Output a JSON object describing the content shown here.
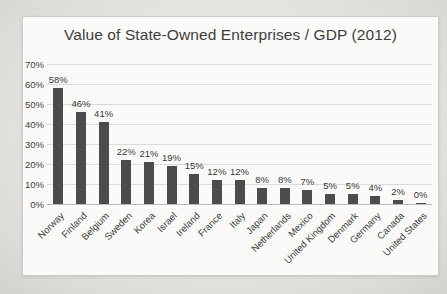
{
  "chart_data": {
    "type": "bar",
    "title": "Value of State-Owned Enterprises / GDP (2012)",
    "categories": [
      "Norway",
      "Finland",
      "Belgium",
      "Sweden",
      "Korea",
      "Israel",
      "Ireland",
      "France",
      "Italy",
      "Japan",
      "Netherlands",
      "Mexico",
      "United Kingdom",
      "Denmark",
      "Germany",
      "Canada",
      "United States"
    ],
    "values": [
      58,
      46,
      41,
      22,
      21,
      19,
      15,
      12,
      12,
      8,
      8,
      7,
      5,
      5,
      4,
      2,
      0
    ],
    "data_labels": [
      "58%",
      "46%",
      "41%",
      "22%",
      "21%",
      "19%",
      "15%",
      "12%",
      "12%",
      "8%",
      "8%",
      "7%",
      "5%",
      "5%",
      "4%",
      "2%",
      "0%"
    ],
    "y_ticks": [
      "0%",
      "10%",
      "20%",
      "30%",
      "40%",
      "50%",
      "60%",
      "70%"
    ],
    "ylim": [
      0,
      70
    ],
    "xlabel": "",
    "ylabel": "",
    "grid": true,
    "legend": false
  },
  "style": {
    "bar_color": "#4c4c4c",
    "grid_color": "#dadada",
    "axis_color": "#bdbdbd",
    "text_color": "#3d3d3d",
    "card_bg": "#fbfaf8",
    "card_border": "#cfccc7",
    "page_bg": "#e7e5e1"
  }
}
